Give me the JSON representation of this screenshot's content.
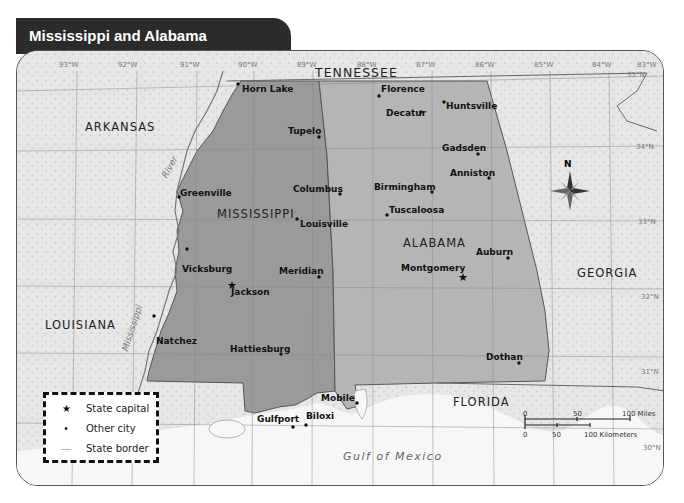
{
  "header": {
    "title": "Mississippi and Alabama"
  },
  "colors": {
    "header_bg": "#2b2b2b",
    "land": "#e6e6e6",
    "mississippi": "#9a9a9a",
    "alabama": "#b5b5b5",
    "water": "#ffffff"
  },
  "longitude_labels": [
    "93°W",
    "92°W",
    "91°W",
    "90°W",
    "89°W",
    "88°W",
    "87°W",
    "86°W",
    "85°W",
    "84°W",
    "83°W"
  ],
  "latitude_labels": [
    "35°N",
    "34°N",
    "33°N",
    "32°N",
    "31°N",
    "30°N"
  ],
  "states": {
    "tennessee": "TENNESSEE",
    "arkansas": "ARKANSAS",
    "mississippi": "MISSISSIPPI",
    "alabama": "ALABAMA",
    "georgia": "GEORGIA",
    "louisiana": "LOUISIANA",
    "florida": "FLORIDA"
  },
  "water": {
    "gulf": "Gulf of Mexico",
    "river_upper": "River",
    "river_lower": "Mississippi"
  },
  "cities": {
    "horn_lake": "Horn Lake",
    "tupelo": "Tupelo",
    "greenville": "Greenville",
    "columbus": "Columbus",
    "louisville": "Louisville",
    "vicksburg": "Vicksburg",
    "jackson": "Jackson",
    "meridian": "Meridian",
    "natchez": "Natchez",
    "hattiesburg": "Hattiesburg",
    "gulfport": "Gulfport",
    "biloxi": "Biloxi",
    "mobile": "Mobile",
    "florence": "Florence",
    "huntsville": "Huntsville",
    "decatur": "Decatur",
    "gadsden": "Gadsden",
    "anniston": "Anniston",
    "birmingham": "Birmingham",
    "tuscaloosa": "Tuscaloosa",
    "auburn": "Auburn",
    "montgomery": "Montgomery",
    "dothan": "Dothan"
  },
  "legend": {
    "items": [
      {
        "symbol": "★",
        "label": "State capital"
      },
      {
        "symbol": "•",
        "label": "Other city"
      },
      {
        "symbol": "—",
        "label": "State border"
      }
    ]
  },
  "scale_bar": {
    "miles": {
      "zero": "0",
      "mid": "50",
      "end": "100 Miles"
    },
    "km": {
      "zero": "0",
      "mid": "50",
      "end": "100 Kilometers"
    }
  },
  "compass": {
    "north": "N"
  }
}
